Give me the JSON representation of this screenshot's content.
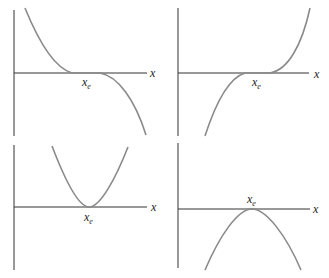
{
  "colors": {
    "axis": "#333333",
    "curve": "#8a8a8a",
    "text": "#222222"
  },
  "panels": [
    {
      "id": "top-left",
      "axis_label": "x",
      "point_label": "x",
      "point_sub": "e",
      "shape": "inflection, decreasing through x_e"
    },
    {
      "id": "top-right",
      "axis_label": "x",
      "point_label": "x",
      "point_sub": "e",
      "shape": "inflection, increasing through x_e"
    },
    {
      "id": "bottom-left",
      "axis_label": "x",
      "point_label": "x",
      "point_sub": "e",
      "shape": "minimum at x_e"
    },
    {
      "id": "bottom-right",
      "axis_label": "x",
      "point_label": "x",
      "point_sub": "e",
      "shape": "maximum at x_e"
    }
  ]
}
